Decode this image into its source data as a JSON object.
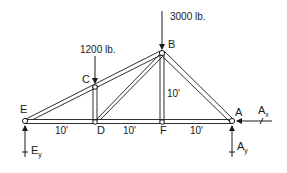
{
  "diagram": {
    "type": "truss",
    "nodes": {
      "A": {
        "label": "A"
      },
      "B": {
        "label": "B"
      },
      "C": {
        "label": "C"
      },
      "D": {
        "label": "D"
      },
      "E": {
        "label": "E"
      },
      "F": {
        "label": "F"
      }
    },
    "members": [
      "E-C",
      "C-B",
      "B-A",
      "E-D",
      "D-F",
      "F-A",
      "C-D",
      "D-B",
      "B-F"
    ],
    "loads": {
      "B": {
        "label": "3000 lb.",
        "direction": "down"
      },
      "C": {
        "label": "1200 lb.",
        "direction": "down"
      }
    },
    "reactions": {
      "Ax": {
        "base": "A",
        "sub": "x",
        "direction": "left"
      },
      "Ay": {
        "base": "A",
        "sub": "y",
        "direction": "up"
      },
      "Ey": {
        "base": "E",
        "sub": "y",
        "direction": "up"
      }
    },
    "dimensions": {
      "ED": "10'",
      "DF": "10'",
      "FA": "10'",
      "BF": "10'"
    },
    "colors": {
      "line": "#1a1a1a",
      "background": "#ffffff"
    }
  }
}
